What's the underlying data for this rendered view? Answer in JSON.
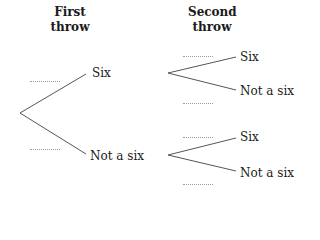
{
  "headers": {
    "first": [
      "First",
      "throw"
    ],
    "second": [
      "Second",
      "throw"
    ]
  },
  "first_throw": {
    "upper": "Six",
    "lower": "Not a six"
  },
  "second_throw": {
    "after_six": {
      "upper": "Six",
      "lower": "Not a six"
    },
    "after_not_six": {
      "upper": "Six",
      "lower": "Not a six"
    }
  },
  "probability_blanks": [
    "",
    "",
    "",
    "",
    "",
    ""
  ],
  "colors": {
    "line": "#555555",
    "dots": "#9a9a9a",
    "text": "#1a1a1a"
  }
}
